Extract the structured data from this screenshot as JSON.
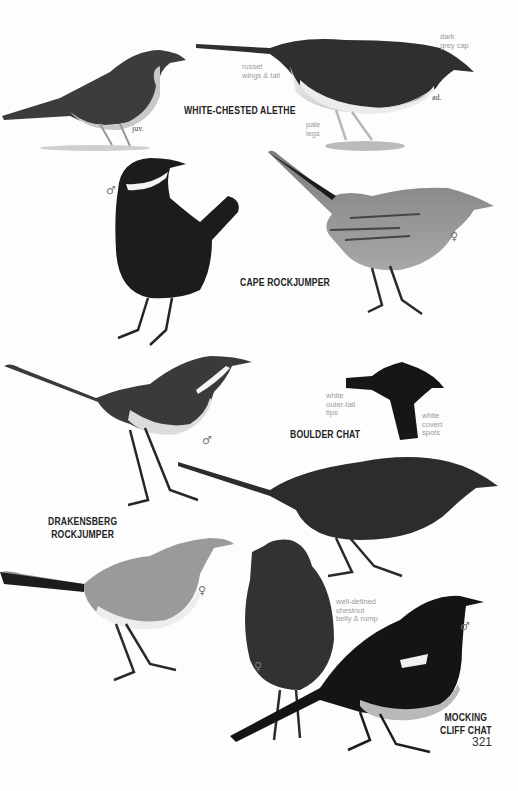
{
  "page": {
    "number": "321",
    "species": [
      {
        "name": "WHITE-CHESTED ALETHE",
        "figures": [
          {
            "label": "juv."
          },
          {
            "label": "ad."
          }
        ],
        "notes": [
          "russet\nwings & tail",
          "dark\ngrey cap",
          "pale\nlegs"
        ]
      },
      {
        "name": "CAPE ROCKJUMPER",
        "figures": [
          {
            "label": "♂"
          },
          {
            "label": "♀"
          }
        ]
      },
      {
        "name": "BOULDER CHAT",
        "notes": [
          "white\nouter-tail\ntips",
          "white\ncovert\nspots"
        ]
      },
      {
        "name": "DRAKENSBERG\nROCKJUMPER",
        "name_line1": "DRAKENSBERG",
        "name_line2": "ROCKJUMPER",
        "figures": [
          {
            "label": "♂"
          },
          {
            "label": "♀"
          }
        ]
      },
      {
        "name": "MOCKING\nCLIFF CHAT",
        "name_line1": "MOCKING",
        "name_line2": "CLIFF CHAT",
        "figures": [
          {
            "label": "♀"
          },
          {
            "label": "♂"
          }
        ],
        "notes": [
          "well-defined\nchestnut\nbelly & rump"
        ]
      }
    ]
  },
  "colors": {
    "background": "#fdfdfd",
    "species_label": "#222222",
    "note_text": "#9a9a9a",
    "bird_dark": "#1c1c1c",
    "bird_mid": "#5a5a5a",
    "bird_light": "#bdbdbd",
    "bird_pale": "#e6e6e6"
  }
}
